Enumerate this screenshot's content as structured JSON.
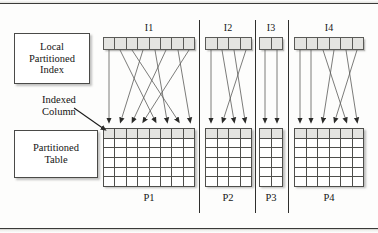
{
  "diagram": {
    "title_absent": true,
    "callouts": [
      {
        "name": "local-partitioned-index",
        "lines": [
          "Local",
          "Partitioned",
          "Index"
        ],
        "text": "Local Partitioned Index"
      },
      {
        "name": "partitioned-table",
        "lines": [
          "Partitioned",
          "Table"
        ],
        "text": "Partitioned Table"
      }
    ],
    "annotations": [
      {
        "name": "indexed-column",
        "lines": [
          "Indexed",
          "Column"
        ],
        "text": "Indexed Column"
      }
    ],
    "index_labels": [
      "I1",
      "I2",
      "I3",
      "I4"
    ],
    "partition_labels": [
      "P1",
      "P2",
      "P3",
      "P4"
    ],
    "index_cell_counts": [
      8,
      4,
      2,
      6
    ],
    "table_columns": [
      8,
      4,
      2,
      6
    ],
    "table_rows": 6,
    "header_row_shaded": true,
    "colors": {
      "line": "#2f2f2d",
      "cell_border": "#4e4e4b",
      "cell_fill": "#ffffff",
      "header_fill": "#e4e4e1",
      "index_fill": "#e4e4e1",
      "background": "#fdfdfc",
      "text": "#151515",
      "shadow": "rgba(122,122,119,0.5)"
    }
  },
  "geometry": {
    "index_bars": [
      {
        "id": "I1",
        "x": 103,
        "y": 37,
        "w": 92,
        "h": 13,
        "cells": 8
      },
      {
        "id": "I2",
        "x": 205,
        "y": 37,
        "w": 47,
        "h": 13,
        "cells": 4
      },
      {
        "id": "I3",
        "x": 259,
        "y": 37,
        "w": 24,
        "h": 13,
        "cells": 2
      },
      {
        "id": "I4",
        "x": 294,
        "y": 37,
        "w": 70,
        "h": 13,
        "cells": 6
      }
    ],
    "tables": [
      {
        "id": "P1",
        "x": 103,
        "y": 128,
        "w": 92,
        "h": 58,
        "cols": 8,
        "rows": 6
      },
      {
        "id": "P2",
        "x": 205,
        "y": 128,
        "w": 47,
        "h": 58,
        "cols": 4,
        "rows": 6
      },
      {
        "id": "P3",
        "x": 259,
        "y": 128,
        "w": 24,
        "h": 58,
        "cols": 2,
        "rows": 6
      },
      {
        "id": "P4",
        "x": 294,
        "y": 128,
        "w": 70,
        "h": 58,
        "cols": 6,
        "rows": 6
      }
    ],
    "dividers": [
      {
        "x": 199,
        "y1": 20,
        "y2": 213
      },
      {
        "x": 255,
        "y1": 20,
        "y2": 213
      },
      {
        "x": 288,
        "y1": 20,
        "y2": 213
      }
    ],
    "index_label_positions": [
      {
        "id": "I1",
        "x": 149,
        "y": 22
      },
      {
        "id": "I2",
        "x": 228,
        "y": 22
      },
      {
        "id": "I3",
        "x": 271,
        "y": 22
      },
      {
        "id": "I4",
        "x": 329,
        "y": 22
      }
    ],
    "partition_label_positions": [
      {
        "id": "P1",
        "x": 149,
        "y": 192
      },
      {
        "id": "P2",
        "x": 228,
        "y": 192
      },
      {
        "id": "P3",
        "x": 271,
        "y": 192
      },
      {
        "id": "P4",
        "x": 329,
        "y": 192
      }
    ],
    "wires": [
      {
        "from": "I1",
        "sx": 109,
        "tx": 109
      },
      {
        "from": "I1",
        "sx": 120,
        "tx": 155
      },
      {
        "from": "I1",
        "sx": 132,
        "tx": 178
      },
      {
        "from": "I1",
        "sx": 143,
        "tx": 121
      },
      {
        "from": "I1",
        "sx": 155,
        "tx": 167
      },
      {
        "from": "I1",
        "sx": 166,
        "tx": 133
      },
      {
        "from": "I1",
        "sx": 178,
        "tx": 190
      },
      {
        "from": "I1",
        "sx": 189,
        "tx": 144
      },
      {
        "from": "I2",
        "sx": 211,
        "tx": 211
      },
      {
        "from": "I2",
        "sx": 222,
        "tx": 234
      },
      {
        "from": "I2",
        "sx": 234,
        "tx": 245
      },
      {
        "from": "I2",
        "sx": 246,
        "tx": 223
      },
      {
        "from": "I3",
        "sx": 265,
        "tx": 265
      },
      {
        "from": "I3",
        "sx": 277,
        "tx": 277
      },
      {
        "from": "I4",
        "sx": 300,
        "tx": 300
      },
      {
        "from": "I4",
        "sx": 311,
        "tx": 311
      },
      {
        "from": "I4",
        "sx": 323,
        "tx": 346
      },
      {
        "from": "I4",
        "sx": 334,
        "tx": 323
      },
      {
        "from": "I4",
        "sx": 346,
        "tx": 357
      },
      {
        "from": "I4",
        "sx": 357,
        "tx": 335
      }
    ],
    "indexed_column_pointer": {
      "x1": 74,
      "y1": 108,
      "x2": 104,
      "y2": 129
    }
  }
}
